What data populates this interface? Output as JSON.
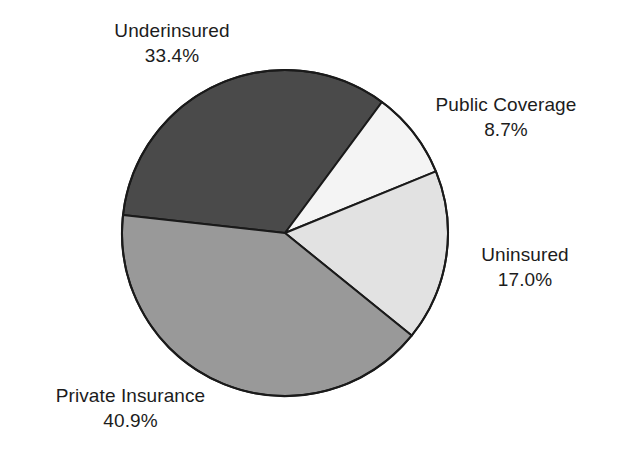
{
  "chart_data": {
    "type": "pie",
    "title": "",
    "subtitle": "",
    "xlabel": "",
    "ylabel": "",
    "legend_position": "none",
    "grid": false,
    "value_unit": "percent",
    "categories": [
      "Underinsured",
      "Public Coverage",
      "Uninsured",
      "Private Insurance"
    ],
    "values": [
      33.4,
      8.7,
      17.0,
      40.9
    ],
    "labels": [
      "33.4%",
      "8.7%",
      "17.0%",
      "40.9%"
    ],
    "colors": [
      "#4a4a4a",
      "#f4f4f4",
      "#e2e2e2",
      "#999999"
    ],
    "slices": [
      {
        "name": "Underinsured",
        "value": 33.4,
        "value_label": "33.4%",
        "color": "#4a4a4a",
        "start_angle_deg": 53.5,
        "end_angle_deg": 173.7,
        "label_position": "top-left"
      },
      {
        "name": "Public Coverage",
        "value": 8.7,
        "value_label": "8.7%",
        "color": "#f4f4f4",
        "start_angle_deg": 22.2,
        "end_angle_deg": 53.5,
        "label_position": "top-right"
      },
      {
        "name": "Uninsured",
        "value": 17.0,
        "value_label": "17.0%",
        "color": "#e2e2e2",
        "start_angle_deg": -39.0,
        "end_angle_deg": 22.2,
        "label_position": "right"
      },
      {
        "name": "Private Insurance",
        "value": 40.9,
        "value_label": "40.9%",
        "color": "#999999",
        "start_angle_deg": -186.3,
        "end_angle_deg": -39.0,
        "label_position": "bottom-left"
      }
    ]
  },
  "figure": {
    "background_color": "#ffffff",
    "outline_color": "#1a1a1a",
    "center_x": 285,
    "center_y": 233,
    "radius": 163
  }
}
